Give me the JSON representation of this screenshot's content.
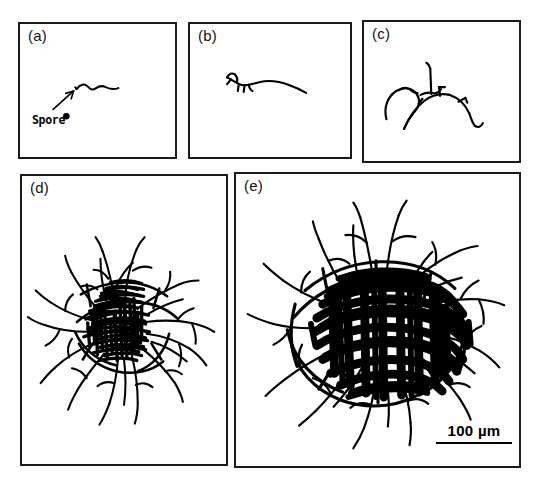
{
  "figure": {
    "background_color": "#ffffff",
    "ink_color": "#000000",
    "width": 542,
    "height": 481,
    "caption_present": false
  },
  "panels": [
    {
      "id": "a",
      "label": "(a)",
      "stage": "germinating-spore",
      "description": "Single spore with a short emerging germ tube",
      "annotation": {
        "text": "Spore",
        "has_arrow": true
      }
    },
    {
      "id": "b",
      "label": "(b)",
      "stage": "hyphal-elongation",
      "description": "Elongated primary hypha with first short branches"
    },
    {
      "id": "c",
      "label": "(c)",
      "stage": "early-branching",
      "description": "Branched hyphae forming looping arcs"
    },
    {
      "id": "d",
      "label": "(d)",
      "stage": "young-mycelium",
      "description": "Dense radiating mycelial colony with open periphery"
    },
    {
      "id": "e",
      "label": "(e)",
      "stage": "mature-mycelium",
      "description": "Very dense near-solid colony with long peripheral hyphae"
    }
  ],
  "scalebar": {
    "value": "100",
    "unit": "µm",
    "text": "100 µm",
    "length_px": 76,
    "panel": "e"
  }
}
